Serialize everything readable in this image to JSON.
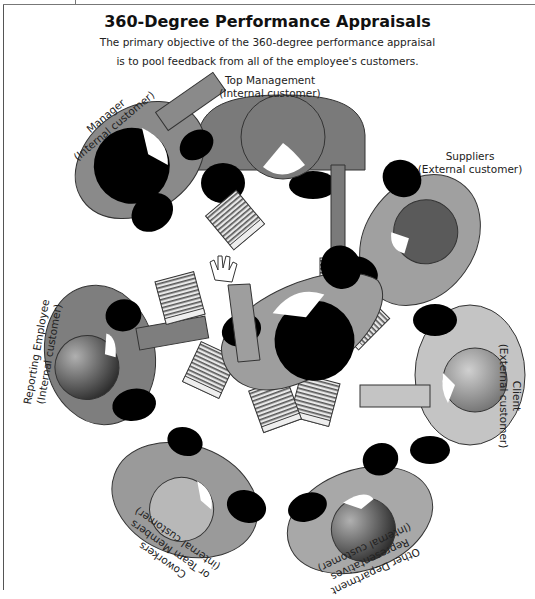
{
  "header": {
    "title": "360-Degree Performance Appraisals",
    "subtitle_line1": "The primary objective of the 360-degree performance appraisal",
    "subtitle_line2": "is to pool feedback from all of the employee's customers."
  },
  "participants": [
    {
      "id": "top-management",
      "name": "Top Management",
      "type": "(Internal customer)"
    },
    {
      "id": "manager",
      "name": "Manager",
      "type": "(Internal customer)"
    },
    {
      "id": "suppliers",
      "name": "Suppliers",
      "type": "(External customer)"
    },
    {
      "id": "client",
      "name": "Client",
      "type": "(External customer)"
    },
    {
      "id": "other-department",
      "name_line1": "Other Department",
      "name_line2": "Representatives",
      "type": "(Internal customer)"
    },
    {
      "id": "coworkers",
      "name_line1": "Coworkers",
      "name_line2": "or Team Members",
      "type": "(internal customer)"
    },
    {
      "id": "reporting-employee",
      "name": "Reporting Employee",
      "type": "(Internal customer)"
    }
  ],
  "center": {
    "id": "employee",
    "gesture": "raised-hand"
  },
  "colors": {
    "body_mid": "#8c8c8c",
    "body_dark": "#6e6e6e",
    "body_light": "#bdbdbd",
    "head_black": "#000000",
    "paper_line": "#555555"
  }
}
